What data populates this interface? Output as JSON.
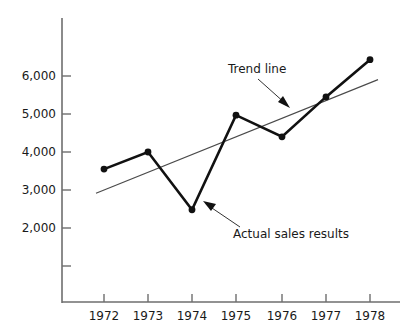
{
  "chart_data": {
    "type": "line",
    "title": "",
    "subtitle": "",
    "xlabel": "",
    "ylabel": "",
    "categories": [
      "1972",
      "1973",
      "1974",
      "1975",
      "1976",
      "1977",
      "1978"
    ],
    "x_tick_labels": [
      "1972",
      "1973",
      "1974",
      "1975",
      "1976",
      "1977",
      "1978"
    ],
    "y_tick_labels": [
      "2,000",
      "3,000",
      "4,000",
      "5,000",
      "6,000"
    ],
    "y_tick_values": [
      2000,
      3000,
      4000,
      5000,
      6000
    ],
    "ylim": [
      1000,
      7000
    ],
    "xlim": [
      "1971.5",
      "1978.5"
    ],
    "grid": false,
    "legend": "none",
    "series": [
      {
        "name": "Actual sales results",
        "style": "solid-thick-with-markers",
        "color": "#111111",
        "values": [
          3550,
          4000,
          2480,
          4970,
          4400,
          5450,
          6430
        ]
      },
      {
        "name": "Trend line",
        "style": "solid-thin",
        "color": "#4a4a4a",
        "values": [
          3000,
          3470,
          3940,
          4410,
          4880,
          5350,
          5820
        ]
      }
    ],
    "annotations": [
      {
        "id": "trend-line-annotation",
        "text": "Trend line",
        "points_to_series": "Trend line",
        "arrow_direction": "down-right"
      },
      {
        "id": "actual-sales-annotation",
        "text": "Actual sales results",
        "points_to_series": "Actual sales results",
        "arrow_direction": "up-left"
      }
    ],
    "colors": {
      "background": "#ffffff",
      "axis": "#6e6e6e",
      "series_actual": "#111111",
      "series_trend": "#4a4a4a",
      "text": "#1a1a1a"
    }
  },
  "axes": {
    "y_ticks": [
      {
        "label": "6,000",
        "y": 76
      },
      {
        "label": "5,000",
        "y": 114
      },
      {
        "label": "4,000",
        "y": 152
      },
      {
        "label": "3,000",
        "y": 190
      },
      {
        "label": "2,000",
        "y": 228
      },
      {
        "label": "",
        "y": 266
      }
    ],
    "x_ticks": [
      {
        "label": "1972",
        "x": 104
      },
      {
        "label": "1973",
        "x": 148
      },
      {
        "label": "1974",
        "x": 192
      },
      {
        "label": "1975",
        "x": 236
      },
      {
        "label": "1976",
        "x": 282
      },
      {
        "label": "1977",
        "x": 326
      },
      {
        "label": "1978",
        "x": 370
      }
    ]
  },
  "annotations": {
    "trend": {
      "label": "Trend line"
    },
    "actual": {
      "label": "Actual sales results"
    }
  }
}
